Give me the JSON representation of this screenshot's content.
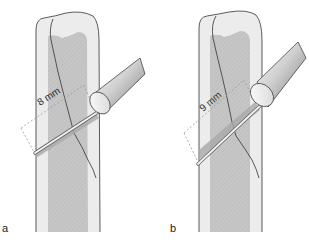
{
  "figure": {
    "panels": [
      {
        "id": "a",
        "label": "a",
        "measurement": "8 mm",
        "description": "Bone with oblique fracture; drill/depth gauge inserted obliquely measuring 8 mm"
      },
      {
        "id": "b",
        "label": "b",
        "measurement": "9 mm",
        "description": "Bone with oblique fracture; drill/depth gauge inserted at steeper angle measuring 9 mm"
      }
    ],
    "colors": {
      "cortex": "#ebebeb",
      "medulla": "#c4c4c4",
      "outline": "#333333",
      "instrument_light": "#f2f2f2",
      "instrument_mid": "#bdbdbd",
      "instrument_dark": "#8a8a8a",
      "drill_channel": "#a8a8a8",
      "dashed": "#9a9a9a"
    }
  }
}
